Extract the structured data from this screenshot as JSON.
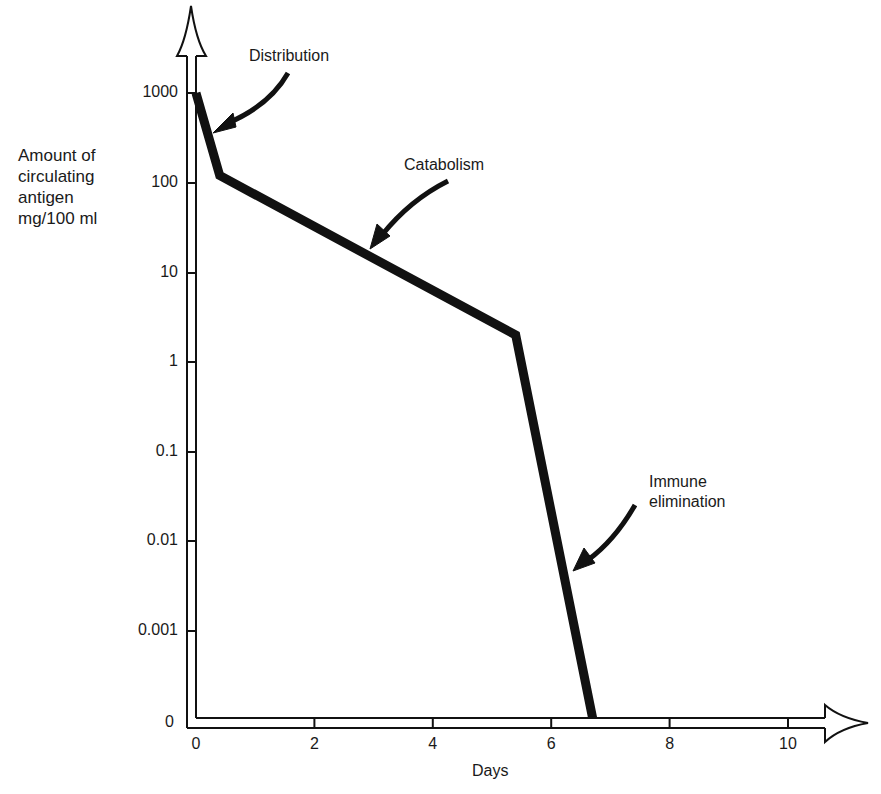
{
  "chart_data": {
    "type": "line",
    "title": "",
    "xlabel": "Days",
    "ylabel": "Amount of\ncirculating\nantigen\nmg/100 ml",
    "yscale": "log",
    "x_ticks": [
      "0",
      "2",
      "4",
      "6",
      "8",
      "10"
    ],
    "y_ticks": [
      "1000",
      "100",
      "10",
      "1",
      "0.1",
      "0.01",
      "0.001",
      "0"
    ],
    "xlim": [
      0,
      11
    ],
    "ylim": [
      0,
      1000
    ],
    "grid": false,
    "legend": null,
    "series": [
      {
        "name": "Circulating antigen",
        "x": [
          0,
          0.4,
          5.4,
          6.7
        ],
        "y": [
          1000,
          120,
          2,
          0
        ]
      }
    ],
    "annotations": [
      {
        "text": "Distribution",
        "phase": "rapid initial drop",
        "x_range": [
          0,
          0.4
        ]
      },
      {
        "text": "Catabolism",
        "phase": "slow decline",
        "x_range": [
          0.4,
          5.4
        ]
      },
      {
        "text": "Immune\nelimination",
        "phase": "steep drop to zero",
        "x_range": [
          5.4,
          6.7
        ]
      }
    ]
  },
  "labels": {
    "ylabel": "Amount of\ncirculating\nantigen\nmg/100 ml",
    "xlabel": "Days",
    "distribution": "Distribution",
    "catabolism": "Catabolism",
    "immune": "Immune\nelimination"
  },
  "colors": {
    "line": "#111111",
    "axis": "#111111",
    "background": "#ffffff"
  }
}
